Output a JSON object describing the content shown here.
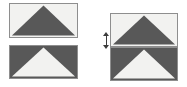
{
  "figure": {
    "title": "",
    "background_color": "#ffffff",
    "width": 187,
    "height": 87
  },
  "colors": {
    "light_fill": "#f2f2f0",
    "dark_fill": "#585858",
    "border": "#8e8e8e",
    "marker": "#3c3c3c",
    "background": "#ffffff"
  },
  "groups": {
    "separated": {
      "label": "",
      "x": 9,
      "y": 3,
      "width": 69,
      "height": 76,
      "gap": 7
    },
    "joined": {
      "label": "",
      "x": 110,
      "y": 13,
      "width": 68,
      "height": 68,
      "gap": 0
    }
  },
  "tiles": [
    {
      "id": "sep-top",
      "group": "separated",
      "fill": "light",
      "triangle_fill": "dark",
      "triangle_direction": "up",
      "x": 9,
      "y": 3,
      "width": 69,
      "height": 35,
      "label": ""
    },
    {
      "id": "sep-bottom",
      "group": "separated",
      "fill": "dark",
      "triangle_fill": "light",
      "triangle_direction": "up",
      "x": 9,
      "y": 45,
      "width": 69,
      "height": 34,
      "label": ""
    },
    {
      "id": "join-top",
      "group": "joined",
      "fill": "light",
      "triangle_fill": "dark",
      "triangle_direction": "up",
      "x": 110,
      "y": 13,
      "width": 68,
      "height": 34,
      "label": ""
    },
    {
      "id": "join-bottom",
      "group": "joined",
      "fill": "dark",
      "triangle_fill": "light",
      "triangle_direction": "up",
      "x": 110,
      "y": 47,
      "width": 68,
      "height": 34,
      "label": ""
    }
  ],
  "marker": {
    "name": "height-arrow",
    "orientation": "vertical",
    "x": 105,
    "y": 33,
    "height": 15,
    "label": "",
    "color": "#3c3c3c"
  },
  "captions": {
    "separated": "",
    "joined": "",
    "marker": ""
  }
}
